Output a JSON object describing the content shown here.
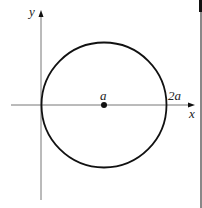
{
  "diagram": {
    "axes": {
      "x_label": "x",
      "y_label": "y"
    },
    "circle": {
      "center_label": "a",
      "right_intercept_label": "2a",
      "left_intercept": "0"
    },
    "colors": {
      "axis": "#777777",
      "circle": "#111111",
      "text": "#222222"
    }
  }
}
